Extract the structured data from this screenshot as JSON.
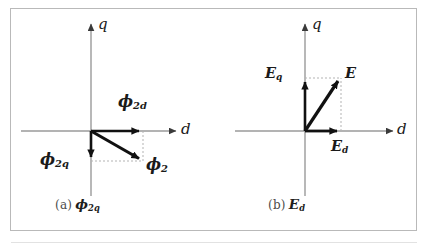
{
  "figure": {
    "type": "vector-phasor-diagram",
    "panel_count": 2,
    "frame_color": "#b9b9b9",
    "background": "#ffffff",
    "axis_color": "#9a9a9a",
    "vector_color": "#111111",
    "projection_line_color": "#b3b3b3"
  },
  "panels": [
    {
      "id": "a",
      "caption_index": "(a)",
      "caption_symbol": "ϕ",
      "caption_sub": "2q",
      "axes": {
        "vertical_label": "q",
        "horizontal_label": "d",
        "origin": {
          "x": 91,
          "y": 131
        }
      },
      "vectors": [
        {
          "name": "phi-2d",
          "label_symbol": "ϕ",
          "label_sub": "2d",
          "from": {
            "x": 91,
            "y": 131
          },
          "to": {
            "x": 143,
            "y": 131
          },
          "direction": "+d",
          "magnitude_px": 52
        },
        {
          "name": "phi-2q",
          "label_symbol": "ϕ",
          "label_sub": "2q",
          "from": {
            "x": 91,
            "y": 131
          },
          "to": {
            "x": 91,
            "y": 161
          },
          "direction": "-q",
          "magnitude_px": 30
        },
        {
          "name": "phi-2",
          "label_symbol": "ϕ",
          "label_sub": "2",
          "from": {
            "x": 91,
            "y": 131
          },
          "to": {
            "x": 143,
            "y": 161
          },
          "direction": "resultant",
          "magnitude_px": 60
        }
      ]
    },
    {
      "id": "b",
      "caption_index": "(b)",
      "caption_symbol": "E",
      "caption_sub": "d",
      "axes": {
        "vertical_label": "q",
        "horizontal_label": "d",
        "origin": {
          "x": 305,
          "y": 131
        }
      },
      "vectors": [
        {
          "name": "e-d",
          "label_symbol": "E",
          "label_sub": "d",
          "from": {
            "x": 305,
            "y": 131
          },
          "to": {
            "x": 341,
            "y": 131
          },
          "direction": "+d",
          "magnitude_px": 36
        },
        {
          "name": "e-q",
          "label_symbol": "E",
          "label_sub": "q",
          "from": {
            "x": 305,
            "y": 131
          },
          "to": {
            "x": 305,
            "y": 78
          },
          "direction": "+q",
          "magnitude_px": 53
        },
        {
          "name": "e",
          "label_symbol": "E",
          "label_sub": "",
          "from": {
            "x": 305,
            "y": 131
          },
          "to": {
            "x": 341,
            "y": 78
          },
          "direction": "resultant",
          "magnitude_px": 64
        }
      ]
    }
  ]
}
